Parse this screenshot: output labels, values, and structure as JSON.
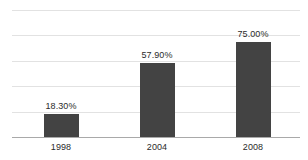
{
  "chart_data": {
    "type": "bar",
    "title": "",
    "subtitle": "",
    "xlabel": "",
    "ylabel": "",
    "categories": [
      "1998",
      "2004",
      "2008"
    ],
    "values": [
      18.3,
      57.9,
      75.0
    ],
    "data_labels": [
      "18.30%",
      "57.90%",
      "75.00%"
    ],
    "ylim": [
      0,
      100
    ],
    "y_ticks": [
      0,
      20,
      40,
      60,
      80,
      100
    ],
    "y_tick_labels_visible": false,
    "grid": true,
    "grid_orientation": "horizontal",
    "legend": false,
    "legend_position": "none",
    "series": [
      {
        "name": "",
        "values": [
          18.3,
          57.9,
          75.0
        ]
      }
    ]
  },
  "style": {
    "bar_color": "#434343",
    "grid_color": "#e2e2e2",
    "axis_color": "#a9a9a9",
    "label_color": "#2b2b2b",
    "background": "#ffffff"
  },
  "axis": {
    "baseline_name": "x-axis-line"
  }
}
